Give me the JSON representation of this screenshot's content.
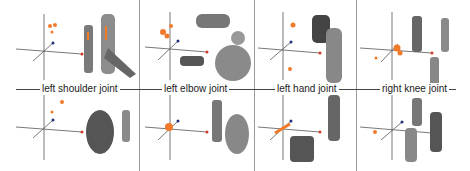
{
  "figure": {
    "type": "joint point-cloud visualization grid",
    "columns": [
      {
        "label": "left shoulder joint"
      },
      {
        "label": "left elbow joint"
      },
      {
        "label": "left hand joint"
      },
      {
        "label": "right knee joint"
      }
    ],
    "rows": 2,
    "colors": {
      "point_cloud": "#f07a2a",
      "axis": "#555555",
      "axis_x_end": "#d23a2a",
      "axis_z_end": "#1f2f7a",
      "figure_gray": "#7a7a7a",
      "divider": "#9a9a9a"
    }
  }
}
